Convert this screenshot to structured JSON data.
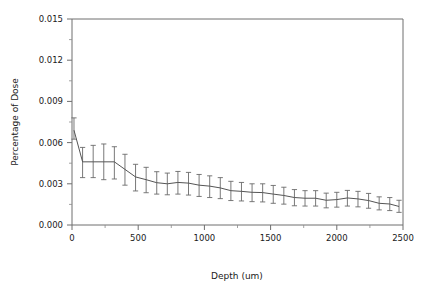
{
  "chart_data": {
    "type": "line",
    "title": "",
    "xlabel": "Depth (um)",
    "ylabel": "Percentage of Dose",
    "xlim": [
      0,
      2500
    ],
    "ylim": [
      0.0,
      0.015
    ],
    "xticks": [
      0,
      500,
      1000,
      1500,
      2000,
      2500
    ],
    "xticklabels": [
      "0",
      "500",
      "1000",
      "1500",
      "2000",
      "2500"
    ],
    "yticks": [
      0.0,
      0.003,
      0.006,
      0.009,
      0.012,
      0.015
    ],
    "yticklabels": [
      "0.000",
      "0.003",
      "0.006",
      "0.009",
      "0.012",
      "0.015"
    ],
    "x_minor_tick_interval": 250,
    "y_minor_tick_interval": 0.0015,
    "grid": false,
    "legend": "none",
    "error_bars": "vertical-with-caps",
    "line_color": "#555555",
    "errorbar_color": "#6a6a6a",
    "axis_color": "#6e6e6e",
    "background_color": "#ffffff",
    "x": [
      15,
      80,
      160,
      240,
      320,
      400,
      480,
      560,
      640,
      720,
      800,
      880,
      960,
      1040,
      1120,
      1200,
      1280,
      1360,
      1440,
      1520,
      1600,
      1680,
      1760,
      1840,
      1920,
      2000,
      2080,
      2160,
      2240,
      2320,
      2400,
      2470
    ],
    "values": [
      0.0069,
      0.0046,
      0.0046,
      0.0046,
      0.0046,
      0.00405,
      0.0035,
      0.0033,
      0.00308,
      0.003,
      0.0031,
      0.00305,
      0.0029,
      0.00283,
      0.0027,
      0.0025,
      0.00245,
      0.00238,
      0.00236,
      0.00225,
      0.00215,
      0.002,
      0.00195,
      0.00195,
      0.0018,
      0.00185,
      0.00197,
      0.0019,
      0.00178,
      0.00158,
      0.00153,
      0.00135
    ],
    "err_low": [
      0.00625,
      0.00345,
      0.00345,
      0.0033,
      0.00335,
      0.0029,
      0.00248,
      0.00235,
      0.00225,
      0.0022,
      0.00225,
      0.00218,
      0.00208,
      0.002,
      0.00192,
      0.00178,
      0.00175,
      0.0017,
      0.00168,
      0.00158,
      0.00152,
      0.0014,
      0.00138,
      0.00138,
      0.00125,
      0.0013,
      0.00138,
      0.00132,
      0.00122,
      0.0011,
      0.00105,
      0.00092
    ],
    "err_high": [
      0.0078,
      0.00565,
      0.0058,
      0.0059,
      0.0057,
      0.00515,
      0.00442,
      0.0042,
      0.00388,
      0.00378,
      0.0039,
      0.00383,
      0.00368,
      0.00358,
      0.00345,
      0.00318,
      0.0031,
      0.003,
      0.003,
      0.00288,
      0.00275,
      0.00258,
      0.0025,
      0.0025,
      0.00232,
      0.00238,
      0.00252,
      0.00245,
      0.0023,
      0.00205,
      0.002,
      0.0018
    ]
  }
}
